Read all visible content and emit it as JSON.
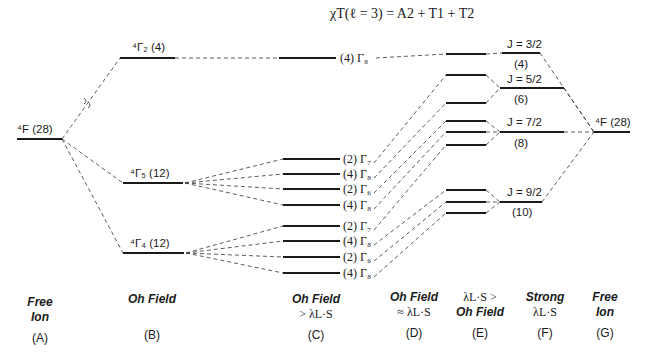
{
  "formula": "χT(ℓ = 3) = A2 + T1 + T2",
  "columns": [
    {
      "id": "A",
      "line1": "Free",
      "line2": "Ion",
      "tag": "(A)"
    },
    {
      "id": "B",
      "line1": "Oh Field",
      "line2": "",
      "tag": "(B)"
    },
    {
      "id": "C",
      "line1": "Oh Field",
      "line2": "> λL·S",
      "tag": "(C)"
    },
    {
      "id": "D",
      "line1": "Oh Field",
      "line2": "≈ λL·S",
      "tag": "(D)"
    },
    {
      "id": "E",
      "line1": "λL·S >",
      "line2": "Oh Field",
      "tag": "(E)"
    },
    {
      "id": "F",
      "line1": "Strong",
      "line2": "λL·S",
      "tag": "(F)"
    },
    {
      "id": "G",
      "line1": "Free",
      "line2": "Ion",
      "tag": "(G)"
    }
  ],
  "levels": {
    "free_ion_left": "⁴F (28)",
    "free_ion_right": "⁴F (28)",
    "oh": [
      {
        "label": "⁴Γ₂ (4)"
      },
      {
        "label": "⁴Γ₅ (12)"
      },
      {
        "label": "⁴Γ₄ (12)"
      }
    ],
    "oh_so": [
      {
        "label": "(4) Γ₈"
      },
      {
        "label": "(2) Γ₇"
      },
      {
        "label": "(4) Γ₈"
      },
      {
        "label": "(2) Γ₆"
      },
      {
        "label": "(4) Γ₈"
      },
      {
        "label": "(2) Γ₇"
      },
      {
        "label": "(4) Γ₈"
      },
      {
        "label": "(2) Γ₆"
      },
      {
        "label": "(4) Γ₈"
      }
    ],
    "j_levels": [
      {
        "j": "J = 3/2",
        "deg": "(4)"
      },
      {
        "j": "J = 5/2",
        "deg": "(6)"
      },
      {
        "j": "J = 7/2",
        "deg": "(8)"
      },
      {
        "j": "J = 9/2",
        "deg": "(10)"
      }
    ]
  }
}
